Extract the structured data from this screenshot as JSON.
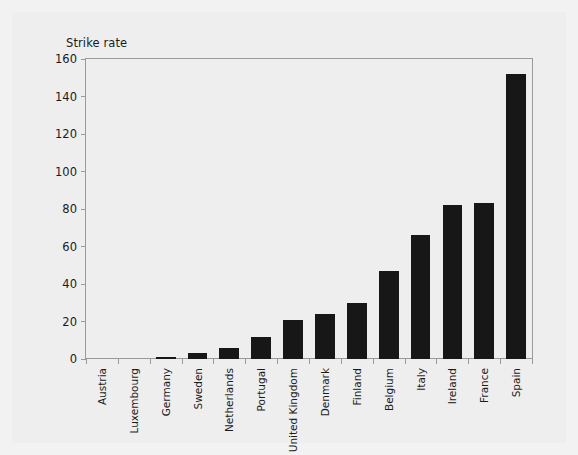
{
  "chart_data": {
    "type": "bar",
    "title": "",
    "ylabel": "Strike rate",
    "xlabel": "",
    "ylim": [
      0,
      160
    ],
    "yticks": [
      0,
      20,
      40,
      60,
      80,
      100,
      120,
      140,
      160
    ],
    "grid": false,
    "legend": null,
    "bar_color": "#171717",
    "categories": [
      "Austria",
      "Luxembourg",
      "Germany",
      "Sweden",
      "Netherlands",
      "Portugal",
      "United Kingdom",
      "Denmark",
      "Finland",
      "Belgium",
      "Italy",
      "Ireland",
      "France",
      "Spain"
    ],
    "values": [
      0,
      0,
      1,
      3,
      6,
      12,
      21,
      24,
      30,
      47,
      66,
      82,
      83,
      152
    ]
  },
  "colors": {
    "background": "#f2f2f2",
    "card": "#eeeeee",
    "frame": "#9a9a9a",
    "text": "#1b1b1b",
    "bar": "#171717"
  }
}
